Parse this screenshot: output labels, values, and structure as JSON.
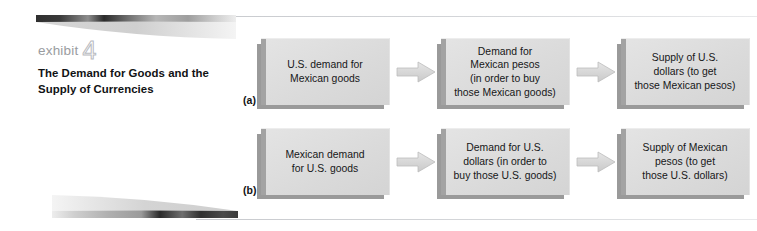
{
  "exhibit": {
    "label_word": "exhibit",
    "number": "4",
    "caption": "The Demand for Goods and the Supply of Currencies"
  },
  "colors": {
    "box_fill": "#dadada",
    "box_shadow": "#9a9a9a",
    "arrow_fill": "#d9d9d9",
    "exhibit_label": "#9a9ca0",
    "text": "#161718",
    "rule": "#d5d7da"
  },
  "rows": [
    {
      "tag": "(a)",
      "nodes": [
        {
          "text": "U.S. demand for\nMexican goods"
        },
        {
          "text": "Demand for\nMexican pesos\n(in order to buy\nthose Mexican goods)"
        },
        {
          "text": "Supply of U.S.\ndollars (to get\nthose Mexican pesos)"
        }
      ],
      "arrows": [
        "arrow-right-icon",
        "arrow-right-icon"
      ]
    },
    {
      "tag": "(b)",
      "nodes": [
        {
          "text": "Mexican demand\nfor U.S. goods"
        },
        {
          "text": "Demand for U.S.\ndollars (in order to\nbuy those U.S. goods)"
        },
        {
          "text": "Supply of Mexican\npesos (to get\nthose U.S. dollars)"
        }
      ],
      "arrows": [
        "arrow-right-icon",
        "arrow-right-icon"
      ]
    }
  ]
}
